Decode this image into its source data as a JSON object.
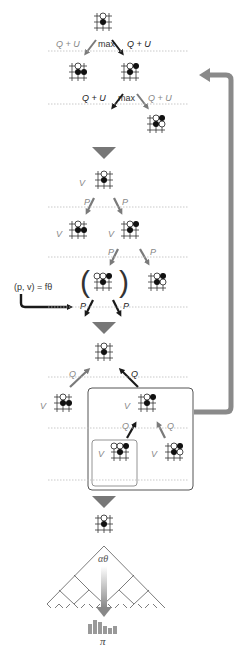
{
  "panels": [
    {
      "id": "select",
      "edge_label_left": "Q + U",
      "edge_label_right": "Q + U",
      "op": "max"
    },
    {
      "id": "expand",
      "value_label": "V",
      "prior_label": "P",
      "network_label": "(p, v) = fθ"
    },
    {
      "id": "backup",
      "value_label": "V",
      "action_value_label": "Q"
    },
    {
      "id": "play",
      "policy_label": "π",
      "search_label": "αθ"
    }
  ],
  "labels": {
    "qu": "Q + U",
    "max": "max",
    "v": "V",
    "p": "P",
    "q": "Q",
    "f": "(p, v) = fθ",
    "alpha": "αθ",
    "pi": "π",
    "paren_l": "(",
    "paren_r": ")"
  },
  "colors": {
    "arrow_gray": "#7a7a7a",
    "arrow_dark": "#1a1a1a",
    "stage_triangle": "#777777",
    "loop_arrow": "#8a8a8a",
    "box_border": "#666666",
    "dotted_sep": "#bbbbbb"
  },
  "policy_bars": [
    14,
    18,
    15,
    11,
    8,
    9
  ]
}
